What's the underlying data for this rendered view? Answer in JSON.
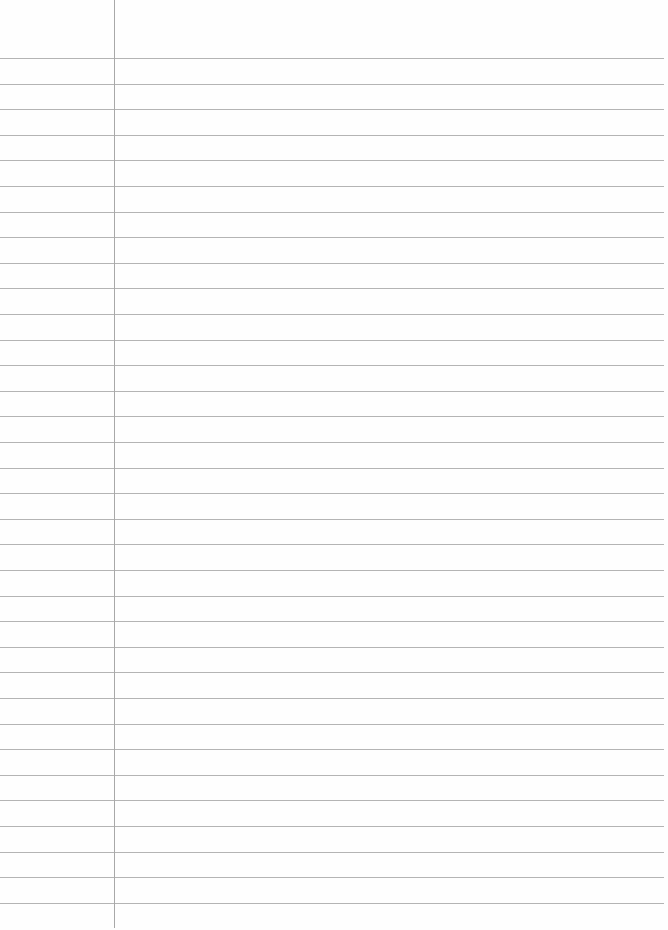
{
  "paper": {
    "type": "lined-paper",
    "background": "#fefefe",
    "rule_color": "#b4b4b4",
    "margin_color": "#a8a8a8",
    "margin_x": 114,
    "first_rule_y": 58,
    "rule_spacing": 25.6,
    "rule_count": 34,
    "rule_width": 664
  }
}
